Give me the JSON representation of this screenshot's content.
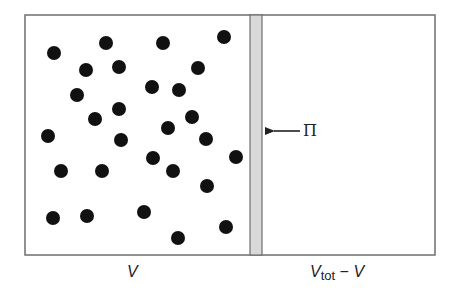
{
  "diagram": {
    "colors": {
      "background": "#ffffff",
      "border": "#6e6e6e",
      "membrane_fill": "#d9d9d9",
      "particle": "#111111",
      "text": "#222222"
    },
    "box": {
      "x": 25,
      "y": 15,
      "width": 410,
      "height": 240
    },
    "membrane": {
      "x": 250,
      "width": 12
    },
    "left_chamber": {
      "label": "V"
    },
    "right_chamber": {
      "label_main": "V",
      "label_sub": "tot",
      "label_rest": " − V"
    },
    "pressure_arrow": {
      "label": "Π",
      "from_x": 300,
      "to_x": 264,
      "y": 131
    },
    "particles": [
      [
        54,
        53
      ],
      [
        106,
        43
      ],
      [
        163,
        43
      ],
      [
        224,
        37
      ],
      [
        86,
        70
      ],
      [
        119,
        67
      ],
      [
        198,
        68
      ],
      [
        77,
        95
      ],
      [
        152,
        87
      ],
      [
        179,
        90
      ],
      [
        119,
        109
      ],
      [
        95,
        119
      ],
      [
        192,
        117
      ],
      [
        168,
        128
      ],
      [
        48,
        136
      ],
      [
        121,
        140
      ],
      [
        206,
        139
      ],
      [
        236,
        157
      ],
      [
        153,
        158
      ],
      [
        61,
        171
      ],
      [
        102,
        171
      ],
      [
        173,
        171
      ],
      [
        207,
        186
      ],
      [
        53,
        218
      ],
      [
        87,
        216
      ],
      [
        144,
        212
      ],
      [
        226,
        227
      ],
      [
        178,
        238
      ]
    ],
    "particle_radius": 7
  }
}
